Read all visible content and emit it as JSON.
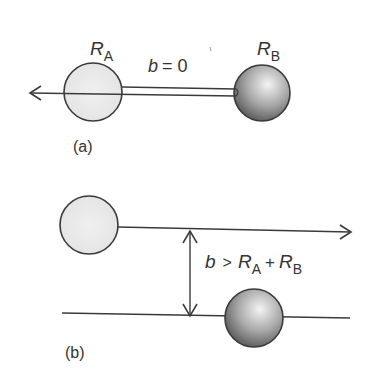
{
  "diagram": {
    "colors": {
      "stroke": "#3a3a3a",
      "sphere_a_fill": "#ebebeb",
      "sphere_b_light": "#f2f2f2",
      "sphere_b_dark": "#5a5a5a",
      "text": "#333333"
    },
    "panel_a": {
      "caption": "(a)",
      "sphere_a_label": {
        "symbol": "R",
        "subscript": "A"
      },
      "sphere_b_label": {
        "symbol": "R",
        "subscript": "B"
      },
      "impact_label": {
        "symbol": "b",
        "relation": "= 0"
      }
    },
    "panel_b": {
      "caption": "(b)",
      "impact_label": {
        "symbol": "b",
        "relation": ">",
        "term1": {
          "symbol": "R",
          "subscript": "A"
        },
        "plus": "+",
        "term2": {
          "symbol": "R",
          "subscript": "B"
        }
      }
    }
  }
}
